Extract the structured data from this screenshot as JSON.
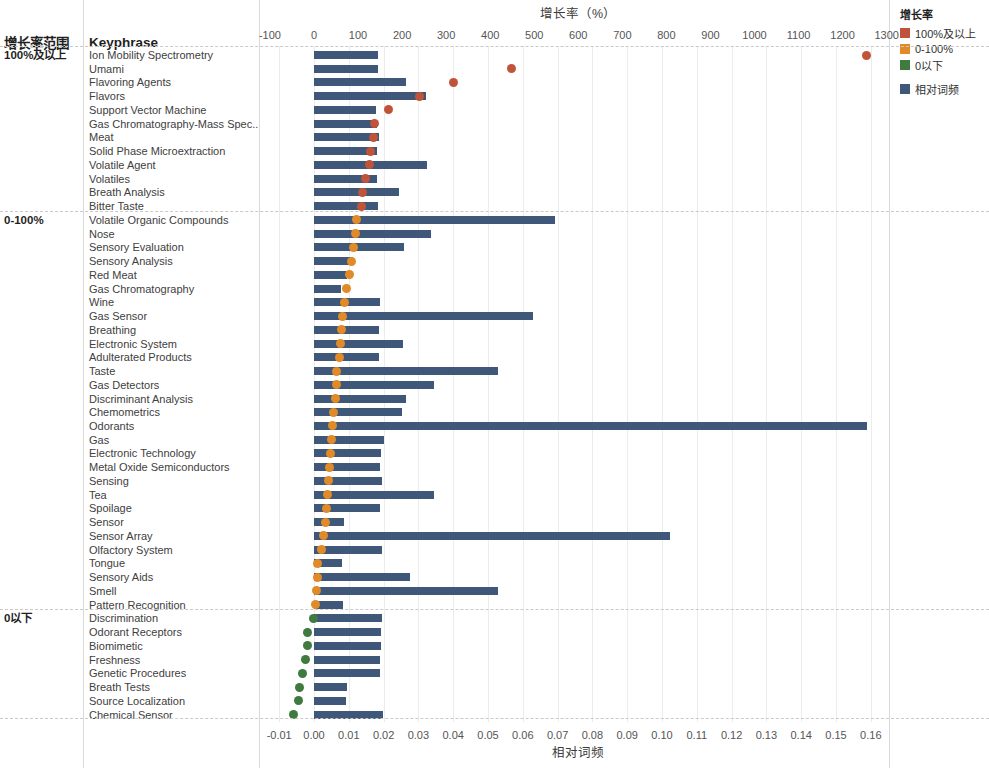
{
  "header": {
    "group_column_label": "增长率范围",
    "keyphrase_column_label": "Keyphrase",
    "top_axis_title": "增长率（%）",
    "bottom_axis_title": "相对词频"
  },
  "legend": {
    "title": "增长率",
    "items": [
      {
        "label": "100%及以上",
        "color": "#c0543a"
      },
      {
        "label": "0-100%",
        "color": "#e08b28"
      },
      {
        "label": "0以下",
        "color": "#3f7a3f"
      }
    ],
    "bar_item": {
      "label": "相对词频",
      "color": "#3f587a"
    }
  },
  "chart_data": {
    "type": "bar",
    "xlabel_top": "增长率（%）",
    "xlabel_bottom": "相对词频",
    "ylabel": "Keyphrase",
    "grid": true,
    "legend_position": "top-right",
    "top_axis": {
      "name": "增长率（%）",
      "ticks": [
        -100,
        0,
        100,
        200,
        300,
        400,
        500,
        600,
        700,
        800,
        900,
        1000,
        1100,
        1200,
        1300
      ],
      "tick_labels": [
        "-100",
        "0",
        "100",
        "200",
        "300",
        "400",
        "500",
        "600",
        "700",
        "800",
        "900",
        "1000",
        "1100",
        "1200",
        "1300"
      ],
      "range": [
        -140,
        1340
      ]
    },
    "bottom_axis": {
      "name": "相对词频",
      "ticks": [
        -0.01,
        0.0,
        0.01,
        0.02,
        0.03,
        0.04,
        0.05,
        0.06,
        0.07,
        0.08,
        0.09,
        0.1,
        0.11,
        0.12,
        0.13,
        0.14,
        0.15,
        0.16
      ],
      "tick_labels": [
        "-0.01",
        "0.00",
        "0.01",
        "0.02",
        "0.03",
        "0.04",
        "0.05",
        "0.06",
        "0.07",
        "0.08",
        "0.09",
        "0.10",
        "0.11",
        "0.12",
        "0.13",
        "0.14",
        "0.15",
        "0.16"
      ],
      "range": [
        -0.014,
        0.164
      ]
    },
    "series": [
      {
        "name": "相对词频",
        "type": "bar",
        "color": "#3f587a",
        "axis": "bottom"
      },
      {
        "name": "增长率",
        "type": "scatter",
        "axis": "top"
      }
    ],
    "groups": [
      {
        "label": "100%及以上",
        "color": "#c0543a",
        "rows": [
          {
            "keyphrase": "Ion Mobility Spectrometry",
            "freq": 0.0185,
            "growth": 1254
          },
          {
            "keyphrase": "Umami",
            "freq": 0.0184,
            "growth": 448
          },
          {
            "keyphrase": "Flavoring Agents",
            "freq": 0.0265,
            "growth": 317
          },
          {
            "keyphrase": "Flavors",
            "freq": 0.0321,
            "growth": 240
          },
          {
            "keyphrase": "Support Vector Machine",
            "freq": 0.0178,
            "growth": 170
          },
          {
            "keyphrase": "Gas Chromatography-Mass Spec..",
            "freq": 0.0182,
            "growth": 137
          },
          {
            "keyphrase": "Meat",
            "freq": 0.0187,
            "growth": 135
          },
          {
            "keyphrase": "Solid Phase Microextraction",
            "freq": 0.0182,
            "growth": 128
          },
          {
            "keyphrase": "Volatile Agent",
            "freq": 0.0325,
            "growth": 125
          },
          {
            "keyphrase": "Volatiles",
            "freq": 0.0181,
            "growth": 117
          },
          {
            "keyphrase": "Breath Analysis",
            "freq": 0.0243,
            "growth": 110
          },
          {
            "keyphrase": "Bitter Taste",
            "freq": 0.0185,
            "growth": 108
          }
        ]
      },
      {
        "label": "0-100%",
        "color": "#e08b28",
        "rows": [
          {
            "keyphrase": "Volatile Organic Compounds",
            "freq": 0.0692,
            "growth": 97
          },
          {
            "keyphrase": "Nose",
            "freq": 0.0336,
            "growth": 94
          },
          {
            "keyphrase": "Sensory Evaluation",
            "freq": 0.0258,
            "growth": 90
          },
          {
            "keyphrase": "Sensory Analysis",
            "freq": 0.0113,
            "growth": 86
          },
          {
            "keyphrase": "Red Meat",
            "freq": 0.0096,
            "growth": 81
          },
          {
            "keyphrase": "Gas Chromatography",
            "freq": 0.0077,
            "growth": 74
          },
          {
            "keyphrase": "Wine",
            "freq": 0.0191,
            "growth": 70
          },
          {
            "keyphrase": "Gas Sensor",
            "freq": 0.0628,
            "growth": 64
          },
          {
            "keyphrase": "Breathing",
            "freq": 0.0188,
            "growth": 62
          },
          {
            "keyphrase": "Electronic System",
            "freq": 0.0256,
            "growth": 60
          },
          {
            "keyphrase": "Adulterated Products",
            "freq": 0.0188,
            "growth": 58
          },
          {
            "keyphrase": "Taste",
            "freq": 0.0528,
            "growth": 52
          },
          {
            "keyphrase": "Gas Detectors",
            "freq": 0.0345,
            "growth": 50
          },
          {
            "keyphrase": "Discriminant Analysis",
            "freq": 0.0263,
            "growth": 48
          },
          {
            "keyphrase": "Chemometrics",
            "freq": 0.0252,
            "growth": 45
          },
          {
            "keyphrase": "Odorants",
            "freq": 0.159,
            "growth": 43
          },
          {
            "keyphrase": "Gas",
            "freq": 0.02,
            "growth": 40
          },
          {
            "keyphrase": "Electronic Technology",
            "freq": 0.0192,
            "growth": 38
          },
          {
            "keyphrase": "Metal Oxide Semiconductors",
            "freq": 0.019,
            "growth": 36
          },
          {
            "keyphrase": "Sensing",
            "freq": 0.0194,
            "growth": 34
          },
          {
            "keyphrase": "Tea",
            "freq": 0.0345,
            "growth": 31
          },
          {
            "keyphrase": "Spoilage",
            "freq": 0.0189,
            "growth": 28
          },
          {
            "keyphrase": "Sensor",
            "freq": 0.0085,
            "growth": 26
          },
          {
            "keyphrase": "Sensor Array",
            "freq": 0.1022,
            "growth": 22
          },
          {
            "keyphrase": "Olfactory System",
            "freq": 0.0196,
            "growth": 16
          },
          {
            "keyphrase": "Tongue",
            "freq": 0.008,
            "growth": 9
          },
          {
            "keyphrase": "Sensory Aids",
            "freq": 0.0275,
            "growth": 7
          },
          {
            "keyphrase": "Smell",
            "freq": 0.0528,
            "growth": 5
          },
          {
            "keyphrase": "Pattern Recognition",
            "freq": 0.0083,
            "growth": 3
          }
        ]
      },
      {
        "label": "0以下",
        "color": "#3f7a3f",
        "rows": [
          {
            "keyphrase": "Discrimination",
            "freq": 0.0194,
            "growth": -2
          },
          {
            "keyphrase": "Odorant Receptors",
            "freq": 0.0193,
            "growth": -14
          },
          {
            "keyphrase": "Biomimetic",
            "freq": 0.0192,
            "growth": -15
          },
          {
            "keyphrase": "Freshness",
            "freq": 0.0189,
            "growth": -20
          },
          {
            "keyphrase": "Genetic Procedures",
            "freq": 0.0191,
            "growth": -27
          },
          {
            "keyphrase": "Breath Tests",
            "freq": 0.0094,
            "growth": -33
          },
          {
            "keyphrase": "Source Localization",
            "freq": 0.0092,
            "growth": -36
          },
          {
            "keyphrase": "Chemical Sensor",
            "freq": 0.0197,
            "growth": -47
          }
        ]
      }
    ]
  }
}
